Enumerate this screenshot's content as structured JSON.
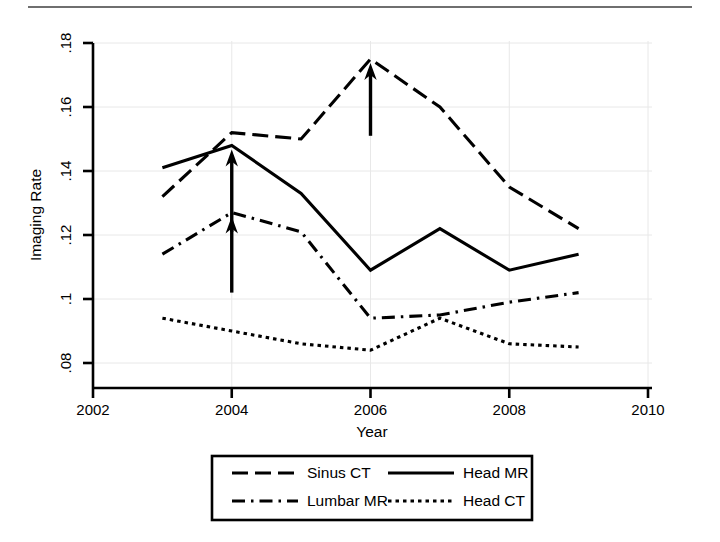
{
  "figure": {
    "title": "",
    "top_rule": "horizontal-rule"
  },
  "axes": {
    "ylabel": "Imaging Rate",
    "xlabel": "Year",
    "y_ticks": [
      ".08",
      ".1",
      ".12",
      ".14",
      ".16",
      ".18"
    ],
    "x_ticks": [
      "2002",
      "2004",
      "2006",
      "2008",
      "2010"
    ]
  },
  "legend": {
    "entries": [
      {
        "label": "Sinus CT",
        "style": "long-dash",
        "sample": "sinus-ct-line-sample"
      },
      {
        "label": "Head MR",
        "style": "solid",
        "sample": "head-mr-line-sample"
      },
      {
        "label": "Lumbar MR",
        "style": "dash-dot",
        "sample": "lumbar-mr-line-sample"
      },
      {
        "label": "Head CT",
        "style": "dotted",
        "sample": "head-ct-line-sample"
      }
    ]
  },
  "annotations": [
    {
      "name": "arrow-2004-head-mr",
      "year": 2004,
      "points_to": 0.148,
      "from": 0.121
    },
    {
      "name": "arrow-2004-lumbar-mr",
      "year": 2004,
      "points_to": 0.127,
      "from": 0.102
    },
    {
      "name": "arrow-2006-sinus-ct",
      "year": 2006,
      "points_to": 0.175,
      "from": 0.151
    }
  ],
  "chart_data": {
    "type": "line",
    "title": "",
    "xlabel": "Year",
    "ylabel": "Imaging Rate",
    "x": [
      2003,
      2004,
      2005,
      2006,
      2007,
      2008,
      2009
    ],
    "xlim": [
      2002,
      2010
    ],
    "ylim": [
      0.08,
      0.18
    ],
    "xticks": [
      2002,
      2004,
      2006,
      2008,
      2010
    ],
    "yticks": [
      0.08,
      0.1,
      0.12,
      0.14,
      0.16,
      0.18
    ],
    "grid": true,
    "legend_position": "below-axes",
    "series": [
      {
        "name": "Sinus CT",
        "dash": "long-dash",
        "values": [
          0.132,
          0.152,
          0.15,
          0.175,
          0.16,
          0.135,
          0.122
        ]
      },
      {
        "name": "Head MR",
        "dash": "solid",
        "values": [
          0.141,
          0.148,
          0.133,
          0.109,
          0.122,
          0.109,
          0.114
        ]
      },
      {
        "name": "Lumbar MR",
        "dash": "dash-dot",
        "values": [
          0.114,
          0.127,
          0.121,
          0.094,
          0.095,
          0.099,
          0.102
        ]
      },
      {
        "name": "Head CT",
        "dash": "dotted",
        "values": [
          0.094,
          0.09,
          0.086,
          0.084,
          0.094,
          0.086,
          0.085
        ]
      }
    ],
    "annotations": [
      {
        "type": "arrow",
        "x": 2004,
        "y": 0.148,
        "tail_y": 0.121,
        "series": "Head MR"
      },
      {
        "type": "arrow",
        "x": 2004,
        "y": 0.127,
        "tail_y": 0.102,
        "series": "Lumbar MR"
      },
      {
        "type": "arrow",
        "x": 2006,
        "y": 0.175,
        "tail_y": 0.151,
        "series": "Sinus CT"
      }
    ]
  }
}
